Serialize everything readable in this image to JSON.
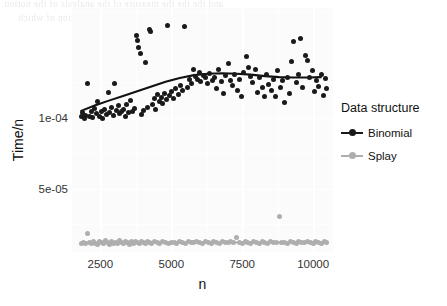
{
  "figure": {
    "background_color": "#ffffff",
    "panel_color": "#fbfbfb",
    "grid_color": "#ffffff"
  },
  "bleed_through": {
    "line1": "and the the the measure of the analysis of the notion",
    "line2": "of a the measure the model and the notion of which"
  },
  "axes": {
    "x": {
      "title": "n",
      "ticks": [
        2500,
        5000,
        7500,
        10000
      ],
      "tick_labels": [
        "2500",
        "5000",
        "7500",
        "10000"
      ],
      "range": [
        1500,
        10700
      ]
    },
    "y": {
      "title": "Time/n",
      "ticks": [
        0.0001,
        5e-05
      ],
      "tick_labels": [
        "1e-04",
        "5e-05"
      ],
      "range": [
        5.5e-06,
        0.0001775
      ]
    }
  },
  "legend": {
    "title": "Data structure",
    "position": "right",
    "entries": [
      {
        "label": "Binomial",
        "color": "#1a1a1a"
      },
      {
        "label": "Splay",
        "color": "#aeaeae"
      }
    ]
  },
  "chart_data": {
    "type": "scatter",
    "title": "",
    "xlabel": "n",
    "ylabel": "Time/n",
    "xlim": [
      1500,
      10700
    ],
    "ylim": [
      5.5e-06,
      0.0001775
    ],
    "grid": true,
    "legend_title": "Data structure",
    "legend_position": "right",
    "series": [
      {
        "name": "Binomial",
        "color": "#1a1a1a",
        "marker": "circle",
        "points": [
          [
            1820,
            0.0001008
          ],
          [
            1880,
            0.0001035
          ],
          [
            1930,
            9.98e-05
          ],
          [
            1990,
            0.000102
          ],
          [
            2050,
            0.0001245
          ],
          [
            2110,
            0.0001012
          ],
          [
            2170,
            0.0001048
          ],
          [
            2230,
            0.0001002
          ],
          [
            2290,
            0.0001065
          ],
          [
            2350,
            0.000103
          ],
          [
            2410,
            0.0001118
          ],
          [
            2470,
            0.0001008
          ],
          [
            2530,
            0.0001042
          ],
          [
            2590,
            9.95e-05
          ],
          [
            2650,
            0.0001058
          ],
          [
            2710,
            0.0001022
          ],
          [
            2770,
            0.000118
          ],
          [
            2830,
            0.0001035
          ],
          [
            2890,
            0.0001072
          ],
          [
            2950,
            0.0001015
          ],
          [
            3010,
            0.000124
          ],
          [
            3070,
            0.0001052
          ],
          [
            3130,
            0.0001088
          ],
          [
            3190,
            0.0001028
          ],
          [
            3250,
            0.0001045
          ],
          [
            3310,
            0.0001062
          ],
          [
            3370,
            0.0001008
          ],
          [
            3430,
            0.0001098
          ],
          [
            3490,
            0.0001035
          ],
          [
            3560,
            0.000112
          ],
          [
            3620,
            0.0001042
          ],
          [
            3700,
            0.0001068
          ],
          [
            3780,
            0.0001582
          ],
          [
            3820,
            0.0001548
          ],
          [
            3860,
            0.0001498
          ],
          [
            3900,
            0.0001455
          ],
          [
            3950,
            0.0001022
          ],
          [
            4010,
            0.0001052
          ],
          [
            4080,
            0.0001392
          ],
          [
            4150,
            0.0001075
          ],
          [
            4220,
            0.0001625
          ],
          [
            4280,
            0.0001608
          ],
          [
            4340,
            0.0001095
          ],
          [
            4400,
            0.0001135
          ],
          [
            4460,
            0.0001058
          ],
          [
            4520,
            0.0001168
          ],
          [
            4580,
            0.0001118
          ],
          [
            4640,
            0.0001145
          ],
          [
            4700,
            0.0001102
          ],
          [
            4760,
            0.0001172
          ],
          [
            4820,
            0.0001128
          ],
          [
            4880,
            0.0001652
          ],
          [
            4940,
            0.0001155
          ],
          [
            5000,
            0.0001185
          ],
          [
            5080,
            0.0001138
          ],
          [
            5160,
            0.0001205
          ],
          [
            5240,
            0.0001162
          ],
          [
            5320,
            0.0001228
          ],
          [
            5400,
            0.0001195
          ],
          [
            5480,
            0.0001645
          ],
          [
            5560,
            0.0001218
          ],
          [
            5640,
            0.0001268
          ],
          [
            5720,
            0.0001242
          ],
          [
            5800,
            0.0001338
          ],
          [
            5860,
            0.0001295
          ],
          [
            5920,
            0.0001272
          ],
          [
            5980,
            0.0001318
          ],
          [
            6040,
            0.0001258
          ],
          [
            6120,
            0.0001302
          ],
          [
            6200,
            0.0001282
          ],
          [
            6280,
            0.0001245
          ],
          [
            6360,
            0.0001312
          ],
          [
            6440,
            0.0001265
          ],
          [
            6520,
            0.0001288
          ],
          [
            6600,
            0.0001208
          ],
          [
            6680,
            0.0001342
          ],
          [
            6760,
            0.0001255
          ],
          [
            6840,
            0.0001175
          ],
          [
            6920,
            0.0001298
          ],
          [
            7000,
            0.0001382
          ],
          [
            7080,
            0.0001262
          ],
          [
            7160,
            0.0001228
          ],
          [
            7240,
            0.0001305
          ],
          [
            7320,
            0.0001195
          ],
          [
            7400,
            0.0001272
          ],
          [
            7480,
            0.0001152
          ],
          [
            7560,
            0.0001318
          ],
          [
            7640,
            0.0001435
          ],
          [
            7720,
            0.0001358
          ],
          [
            7800,
            0.0001292
          ],
          [
            7880,
            0.0001248
          ],
          [
            7960,
            0.0001338
          ],
          [
            8040,
            0.0001178
          ],
          [
            8120,
            0.0001282
          ],
          [
            8200,
            0.0001218
          ],
          [
            8280,
            0.0001148
          ],
          [
            8360,
            0.0001305
          ],
          [
            8440,
            0.0001238
          ],
          [
            8520,
            0.0001192
          ],
          [
            8600,
            0.0001272
          ],
          [
            8680,
            0.0001148
          ],
          [
            8760,
            0.0001335
          ],
          [
            8840,
            0.0001215
          ],
          [
            8920,
            0.0001262
          ],
          [
            9000,
            0.0001108
          ],
          [
            9080,
            0.0001288
          ],
          [
            9160,
            0.0001172
          ],
          [
            9240,
            0.0001398
          ],
          [
            9320,
            0.0001538
          ],
          [
            9400,
            0.0001248
          ],
          [
            9480,
            0.0001305
          ],
          [
            9560,
            0.0001562
          ],
          [
            9640,
            0.0001215
          ],
          [
            9720,
            0.0001438
          ],
          [
            9800,
            0.0001402
          ],
          [
            9880,
            0.0001285
          ],
          [
            9960,
            0.0001332
          ],
          [
            10040,
            0.0001188
          ],
          [
            10120,
            0.0001262
          ],
          [
            10200,
            0.0001225
          ],
          [
            10280,
            0.0001308
          ],
          [
            10360,
            0.0001158
          ],
          [
            10420,
            0.0001278
          ],
          [
            10480,
            0.0001205
          ]
        ],
        "trend_line": {
          "type": "smooth",
          "points": [
            [
              1800,
              0.0001048
            ],
            [
              2300,
              0.0001088
            ],
            [
              2800,
              0.0001122
            ],
            [
              3300,
              0.0001155
            ],
            [
              3800,
              0.0001188
            ],
            [
              4300,
              0.0001222
            ],
            [
              4800,
              0.0001255
            ],
            [
              5300,
              0.0001282
            ],
            [
              5800,
              0.0001302
            ],
            [
              6300,
              0.0001312
            ],
            [
              6800,
              0.0001315
            ],
            [
              7300,
              0.0001312
            ],
            [
              7800,
              0.0001305
            ],
            [
              8300,
              0.0001295
            ],
            [
              8800,
              0.0001288
            ],
            [
              9300,
              0.0001285
            ],
            [
              9800,
              0.0001285
            ],
            [
              10300,
              0.0001288
            ]
          ]
        }
      },
      {
        "name": "Splay",
        "color": "#aeaeae",
        "marker": "circle",
        "points": [
          [
            1850,
            1.18e-05
          ],
          [
            1920,
            1.22e-05
          ],
          [
            1990,
            1.15e-05
          ],
          [
            2060,
            1.82e-05
          ],
          [
            2130,
            1.25e-05
          ],
          [
            2200,
            1.12e-05
          ],
          [
            2270,
            1.28e-05
          ],
          [
            2340,
            1.18e-05
          ],
          [
            2410,
            1.08e-05
          ],
          [
            2480,
            1.32e-05
          ],
          [
            2550,
            1.2e-05
          ],
          [
            2620,
            1.15e-05
          ],
          [
            2690,
            1.35e-05
          ],
          [
            2760,
            1.22e-05
          ],
          [
            2830,
            1.1e-05
          ],
          [
            2900,
            1.28e-05
          ],
          [
            2970,
            1.18e-05
          ],
          [
            3040,
            1.25e-05
          ],
          [
            3110,
            1.12e-05
          ],
          [
            3180,
            1.38e-05
          ],
          [
            3250,
            1.2e-05
          ],
          [
            3320,
            1.15e-05
          ],
          [
            3390,
            1.3e-05
          ],
          [
            3460,
            1.22e-05
          ],
          [
            3530,
            1.08e-05
          ],
          [
            3600,
            1.26e-05
          ],
          [
            3670,
            1.18e-05
          ],
          [
            3740,
            1.32e-05
          ],
          [
            3810,
            1.2e-05
          ],
          [
            3880,
            1.14e-05
          ],
          [
            3950,
            1.28e-05
          ],
          [
            4020,
            1.22e-05
          ],
          [
            4090,
            1.16e-05
          ],
          [
            4160,
            1.3e-05
          ],
          [
            4230,
            1.24e-05
          ],
          [
            4300,
            1.18e-05
          ],
          [
            4400,
            1.26e-05
          ],
          [
            4500,
            1.2e-05
          ],
          [
            4600,
            1.14e-05
          ],
          [
            4700,
            1.28e-05
          ],
          [
            4800,
            1.22e-05
          ],
          [
            4900,
            1.18e-05
          ],
          [
            5000,
            1.25e-05
          ],
          [
            5100,
            1.2e-05
          ],
          [
            5200,
            1.16e-05
          ],
          [
            5300,
            1.28e-05
          ],
          [
            5400,
            1.22e-05
          ],
          [
            5500,
            1.18e-05
          ],
          [
            5600,
            1.3e-05
          ],
          [
            5700,
            1.24e-05
          ],
          [
            5800,
            1.19e-05
          ],
          [
            5900,
            1.26e-05
          ],
          [
            6000,
            1.21e-05
          ],
          [
            6100,
            1.17e-05
          ],
          [
            6200,
            1.29e-05
          ],
          [
            6300,
            1.23e-05
          ],
          [
            6400,
            1.18e-05
          ],
          [
            6500,
            1.27e-05
          ],
          [
            6600,
            1.22e-05
          ],
          [
            6700,
            1.16e-05
          ],
          [
            6800,
            1.3e-05
          ],
          [
            6900,
            1.24e-05
          ],
          [
            7000,
            1.19e-05
          ],
          [
            7100,
            1.26e-05
          ],
          [
            7200,
            1.21e-05
          ],
          [
            7300,
            1.55e-05
          ],
          [
            7400,
            1.24e-05
          ],
          [
            7500,
            1.18e-05
          ],
          [
            7600,
            1.28e-05
          ],
          [
            7700,
            1.22e-05
          ],
          [
            7800,
            1.17e-05
          ],
          [
            7900,
            1.29e-05
          ],
          [
            8000,
            1.23e-05
          ],
          [
            8100,
            1.18e-05
          ],
          [
            8200,
            1.27e-05
          ],
          [
            8300,
            1.22e-05
          ],
          [
            8400,
            1.16e-05
          ],
          [
            8500,
            1.3e-05
          ],
          [
            8600,
            1.24e-05
          ],
          [
            8700,
            1.19e-05
          ],
          [
            8800,
            3.02e-05
          ],
          [
            8900,
            1.25e-05
          ],
          [
            9000,
            1.2e-05
          ],
          [
            9100,
            1.16e-05
          ],
          [
            9200,
            1.28e-05
          ],
          [
            9300,
            1.22e-05
          ],
          [
            9400,
            1.18e-05
          ],
          [
            9500,
            1.3e-05
          ],
          [
            9600,
            1.24e-05
          ],
          [
            9700,
            1.19e-05
          ],
          [
            9800,
            1.27e-05
          ],
          [
            9900,
            1.22e-05
          ],
          [
            10000,
            1.17e-05
          ],
          [
            10100,
            1.29e-05
          ],
          [
            10200,
            1.23e-05
          ],
          [
            10300,
            1.18e-05
          ],
          [
            10400,
            1.26e-05
          ],
          [
            10480,
            1.21e-05
          ]
        ],
        "trend_line": {
          "type": "smooth",
          "points": [
            [
              1800,
              1.22e-05
            ],
            [
              3000,
              1.22e-05
            ],
            [
              4500,
              1.22e-05
            ],
            [
              6000,
              1.22e-05
            ],
            [
              7500,
              1.22e-05
            ],
            [
              9000,
              1.22e-05
            ],
            [
              10400,
              1.22e-05
            ]
          ]
        }
      }
    ]
  }
}
